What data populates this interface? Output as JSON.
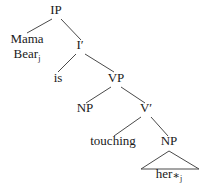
{
  "figure": {
    "kind": "syntax-tree",
    "sentence": "Mama Bear is touching her",
    "background_color": "#ffffff",
    "line_color": "#4a4a4a",
    "text_color": "#1a1a1a"
  },
  "nodes": {
    "ip": {
      "label": "IP",
      "x": 56,
      "y": 14
    },
    "subject": {
      "line1": "Mama",
      "line2": "Bear",
      "subscript": "j",
      "x": 27,
      "y": 42
    },
    "ibar": {
      "label": "I",
      "prime": "′",
      "x": 80,
      "y": 49
    },
    "is": {
      "label": "is",
      "x": 58,
      "y": 82
    },
    "vp": {
      "label": "VP",
      "x": 116,
      "y": 82
    },
    "np_subject_trace": {
      "label": "NP",
      "x": 85,
      "y": 112
    },
    "vbar": {
      "label": "V",
      "prime": "′",
      "x": 146,
      "y": 112
    },
    "touching": {
      "label": "touching",
      "x": 113,
      "y": 145
    },
    "np_object": {
      "label": "NP",
      "x": 169,
      "y": 145
    },
    "her": {
      "label": "her",
      "star": "∗",
      "subscript": "j",
      "x": 169,
      "y": 178
    }
  },
  "edges": [
    {
      "name": "ip-to-subject",
      "x1": 52,
      "y1": 19,
      "x2": 27,
      "y2": 33
    },
    {
      "name": "ip-to-ibar",
      "x1": 61,
      "y1": 19,
      "x2": 81,
      "y2": 40
    },
    {
      "name": "ibar-to-is",
      "x1": 76,
      "y1": 54,
      "x2": 58,
      "y2": 72
    },
    {
      "name": "ibar-to-vp",
      "x1": 85,
      "y1": 54,
      "x2": 114,
      "y2": 72
    },
    {
      "name": "vp-to-np",
      "x1": 111,
      "y1": 87,
      "x2": 86,
      "y2": 103
    },
    {
      "name": "vp-to-vbar",
      "x1": 121,
      "y1": 87,
      "x2": 145,
      "y2": 103
    },
    {
      "name": "vbar-to-touching",
      "x1": 141,
      "y1": 117,
      "x2": 114,
      "y2": 136
    },
    {
      "name": "vbar-to-np",
      "x1": 151,
      "y1": 117,
      "x2": 168,
      "y2": 136
    }
  ],
  "triangle": {
    "name": "np-object-triangle",
    "apex_x": 169,
    "apex_y": 151,
    "left_x": 141,
    "right_x": 199,
    "base_y": 169
  }
}
